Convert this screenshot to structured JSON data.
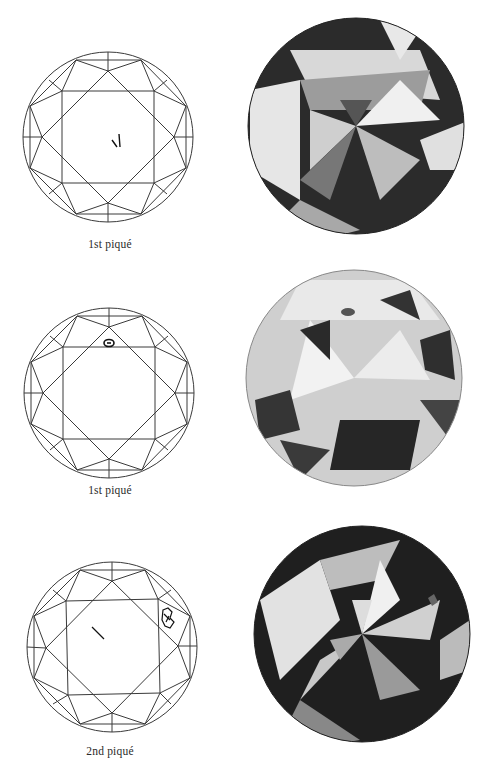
{
  "plates": [
    {
      "caption": "1st piqué",
      "diagram": {
        "cx": 108,
        "cy": 137,
        "r": 85,
        "inclusion": "feather-marks-center"
      },
      "photo": {
        "cx": 356,
        "cy": 126,
        "r": 108,
        "tone": "dark"
      },
      "caption_y": 238
    },
    {
      "caption": "1st piqué",
      "diagram": {
        "cx": 109,
        "cy": 393,
        "r": 85,
        "inclusion": "crystal-near-top-table-edge"
      },
      "photo": {
        "cx": 354,
        "cy": 378,
        "r": 108,
        "tone": "light"
      },
      "caption_y": 484
    },
    {
      "caption": "2nd piqué",
      "diagram": {
        "cx": 112,
        "cy": 647,
        "r": 85,
        "inclusion": "cloud-right-plus-needle-center"
      },
      "photo": {
        "cx": 362,
        "cy": 634,
        "r": 108,
        "tone": "dark"
      },
      "caption_y": 745
    }
  ],
  "colors": {
    "line": "#3a3a3a",
    "ink": "#222222",
    "paper": "#ffffff"
  }
}
